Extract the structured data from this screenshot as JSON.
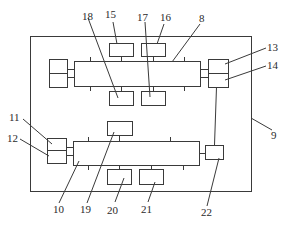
{
  "diagram": {
    "type": "schematic block diagram",
    "colors": {
      "line": "#3a3a3a",
      "text": "#2a2a2a",
      "background": "#ffffff"
    },
    "labels": {
      "l8": "8",
      "l9": "9",
      "l10": "10",
      "l11": "11",
      "l12": "12",
      "l13": "13",
      "l14": "14",
      "l15": "15",
      "l16": "16",
      "l17": "17",
      "l18": "18",
      "l19": "19",
      "l20": "20",
      "l21": "21",
      "l22": "22"
    },
    "components": [
      {
        "id": "8",
        "desc": "upper main bar"
      },
      {
        "id": "9",
        "desc": "outer frame"
      },
      {
        "id": "10",
        "desc": "lower main bar"
      },
      {
        "id": "11",
        "desc": "lower-left upper box"
      },
      {
        "id": "12",
        "desc": "lower-left lower box"
      },
      {
        "id": "13",
        "desc": "upper-right upper box"
      },
      {
        "id": "14",
        "desc": "upper-right lower box"
      },
      {
        "id": "15",
        "desc": "upper top-left box"
      },
      {
        "id": "16",
        "desc": "upper top-right box"
      },
      {
        "id": "17",
        "desc": "upper bottom-right box"
      },
      {
        "id": "18",
        "desc": "upper bottom-left box"
      },
      {
        "id": "19",
        "desc": "lower top box"
      },
      {
        "id": "20",
        "desc": "lower bottom-left box"
      },
      {
        "id": "21",
        "desc": "lower bottom-right box"
      },
      {
        "id": "22",
        "desc": "lower right box"
      }
    ]
  }
}
